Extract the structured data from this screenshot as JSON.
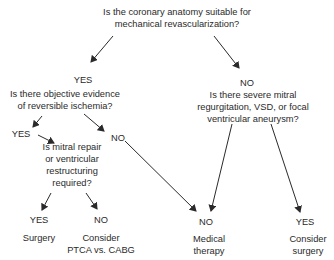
{
  "diagram": {
    "type": "decision-tree",
    "root_question": {
      "line1": "Is the coronary anatomy suitable for",
      "line2": "mechanical revascularization?"
    },
    "yes_branch": {
      "label": "YES",
      "question": {
        "line1": "Is there objective evidence",
        "line2": "of reversible ischemia?"
      },
      "yes_branch": {
        "label": "YES",
        "question": {
          "line1": "Is mitral repair",
          "line2": "or ventricular",
          "line3": "restructuring",
          "line4": "required?"
        },
        "yes": {
          "label": "YES",
          "outcome": "Surgery"
        },
        "no": {
          "label": "NO",
          "outcome_line1": "Consider",
          "outcome_line2": "PTCA vs. CABG"
        }
      },
      "no_branch": {
        "label": "NO",
        "leads_to": "Medical therapy"
      }
    },
    "no_branch": {
      "label": "NO",
      "question": {
        "line1": "Is there severe mitral",
        "line2": "regurgitation, VSD, or focal",
        "line3": "ventricular aneurysm?"
      },
      "no": {
        "label": "NO",
        "outcome_line1": "Medical",
        "outcome_line2": "therapy"
      },
      "yes": {
        "label": "YES",
        "outcome_line1": "Consider",
        "outcome_line2": "surgery"
      }
    },
    "colors": {
      "text": "#2a2a2a",
      "arrow": "#2a2a2a",
      "background": "#ffffff"
    }
  }
}
